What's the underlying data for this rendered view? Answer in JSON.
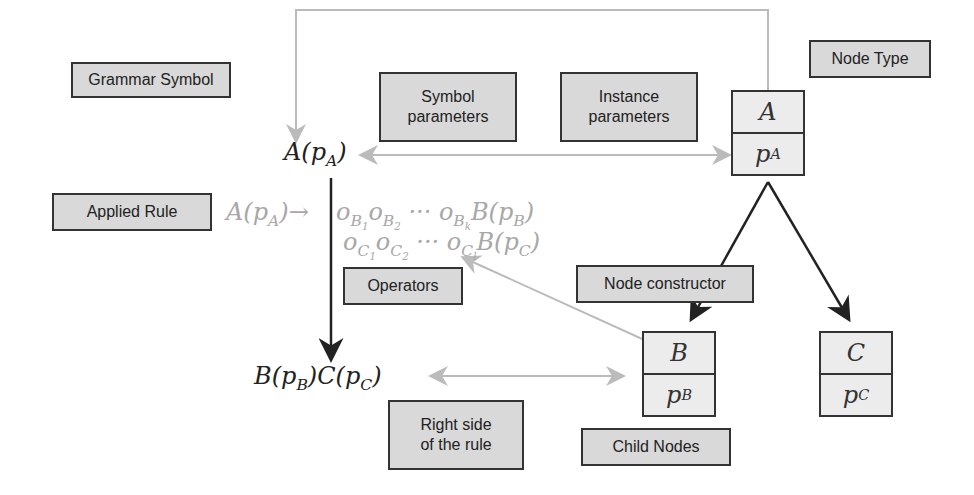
{
  "labels": {
    "grammar_symbol": "Grammar Symbol",
    "symbol_parameters_l1": "Symbol",
    "symbol_parameters_l2": "parameters",
    "instance_parameters_l1": "Instance",
    "instance_parameters_l2": "parameters",
    "node_type": "Node Type",
    "applied_rule": "Applied Rule",
    "operators": "Operators",
    "node_constructor": "Node constructor",
    "right_side_l1": "Right side",
    "right_side_l2": "of the rule",
    "child_nodes": "Child Nodes"
  },
  "math": {
    "symbol_A": "A(",
    "p": "p",
    "sub_A": "A",
    "close": ")",
    "rule_lhs": "A(",
    "arrow": "→",
    "rule_line1": "o",
    "rhs_B": "B(",
    "rhs_C": "C(",
    "sub_B": "B",
    "sub_C": "C",
    "dots": " ··· "
  },
  "nodes": {
    "A": {
      "type": "A",
      "param": "p",
      "sub": "A"
    },
    "B": {
      "type": "B",
      "param": "p",
      "sub": "B"
    },
    "C": {
      "type": "C",
      "param": "p",
      "sub": "C"
    }
  },
  "colors": {
    "dark": "#222222",
    "light": "#bbbbbb",
    "box_fill": "#d9d9d9"
  }
}
